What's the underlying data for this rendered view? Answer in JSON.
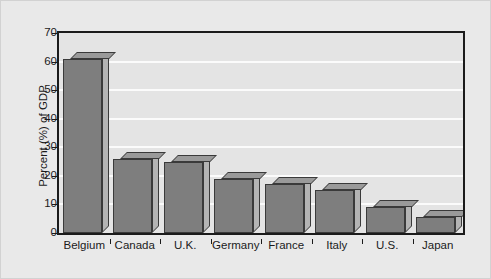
{
  "chart_data": {
    "type": "bar",
    "title": "",
    "xlabel": "",
    "ylabel": "Percent (%) of GDP",
    "categories": [
      "Belgium",
      "Canada",
      "U.K.",
      "Germany",
      "France",
      "Italy",
      "U.S.",
      "Japan"
    ],
    "values": [
      61,
      26,
      25,
      19,
      17,
      15,
      9,
      5.5
    ],
    "ylim": [
      0,
      70
    ],
    "yticks": [
      0,
      10,
      20,
      30,
      40,
      50,
      60,
      70
    ],
    "ytick_labels": [
      "0",
      "10",
      "20",
      "30",
      "40",
      "50",
      "60",
      "70"
    ],
    "grid": true,
    "grid_axis": "y",
    "legend": null,
    "style": "3d-bar",
    "colors": {
      "bar_front": "#7e7e7e",
      "bar_top": "#9a9a9a",
      "bar_side": "#b4b4b4",
      "bar_edge": "#3a3a3a",
      "plot_background": "#e4e4e4",
      "figure_background": "#e9e9e9",
      "gridline": "#fbfbfb",
      "axis": "#1b1b1b",
      "text": "#1b1b1b"
    }
  }
}
